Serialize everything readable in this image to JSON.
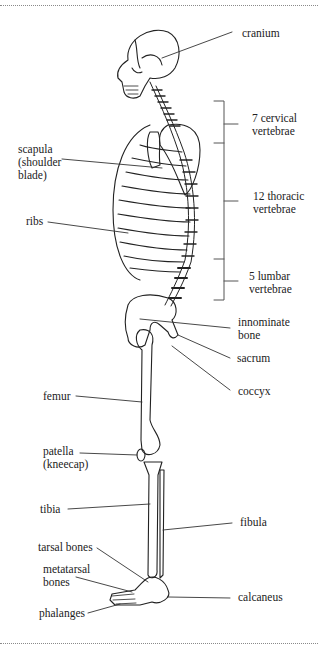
{
  "figure": {
    "type": "anatomical-diagram",
    "line_color": "#222222",
    "background": "#ffffff"
  },
  "labels": {
    "cranium": "cranium",
    "cervical": "7 cervical\nvertebrae",
    "scapula": "scapula\n(shoulder\nblade)",
    "thoracic": "12 thoracic\nvertebrae",
    "ribs": "ribs",
    "lumbar": "5 lumbar\nvertebrae",
    "innominate": "innominate\nbone",
    "sacrum": "sacrum",
    "coccyx": "coccyx",
    "femur": "femur",
    "patella": "patella\n(kneecap)",
    "tibia": "tibia",
    "fibula": "fibula",
    "tarsal": "tarsal bones",
    "metatarsal": "metatarsal\nbones",
    "calcaneus": "calcaneus",
    "phalanges": "phalanges"
  }
}
